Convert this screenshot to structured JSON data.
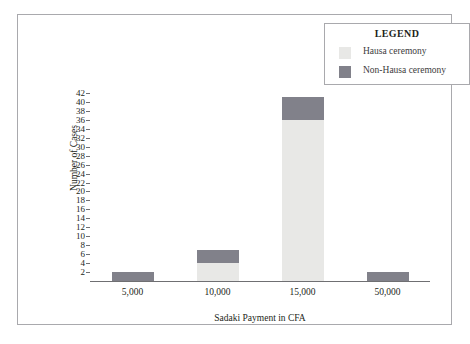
{
  "chart_data": {
    "type": "bar",
    "subtype": "stacked-vertical",
    "title": "",
    "xlabel": "Sadaki Payment in CFA",
    "ylabel": "Number of Cases",
    "categories": [
      "5,000",
      "10,000",
      "15,000",
      "50,000"
    ],
    "series": [
      {
        "name": "Hausa ceremony",
        "color": "#e8e8e6",
        "values": [
          0,
          4,
          36,
          0
        ]
      },
      {
        "name": "Non-Hausa ceremony",
        "color": "#81818a",
        "values": [
          2,
          3,
          5,
          2
        ]
      }
    ],
    "ylim": [
      0,
      42
    ],
    "ytick_step": 2,
    "yticks": [
      42,
      40,
      38,
      36,
      34,
      32,
      30,
      28,
      26,
      24,
      22,
      20,
      18,
      16,
      14,
      12,
      10,
      8,
      6,
      4,
      2
    ],
    "grid": false,
    "legend_position": "top-right"
  },
  "legend": {
    "title": "LEGEND",
    "items": [
      {
        "label": "Hausa ceremony",
        "color": "#e8e8e6"
      },
      {
        "label": "Non-Hausa ceremony",
        "color": "#81818a"
      }
    ]
  },
  "colors": {
    "frame": "#a9a9ad",
    "axis": "#6f6f72",
    "text": "#231f20",
    "background": "#ffffff",
    "hausa": "#e8e8e6",
    "non_hausa": "#81818a"
  }
}
